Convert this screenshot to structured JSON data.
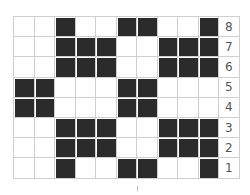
{
  "diagram": {
    "type": "knitting-chart",
    "columns": 10,
    "rows": 8,
    "colors": {
      "filled": "#2b2b2b",
      "empty": "#ffffff",
      "grid": "#cfcfcf",
      "label": "#555555"
    },
    "row_labels": [
      "8",
      "7",
      "6",
      "5",
      "4",
      "3",
      "2",
      "1"
    ],
    "pattern": [
      [
        0,
        0,
        1,
        0,
        0,
        1,
        1,
        0,
        0,
        1
      ],
      [
        0,
        0,
        1,
        1,
        1,
        0,
        0,
        1,
        1,
        1
      ],
      [
        0,
        0,
        1,
        1,
        1,
        0,
        0,
        1,
        1,
        1
      ],
      [
        1,
        1,
        0,
        0,
        0,
        1,
        1,
        0,
        0,
        0
      ],
      [
        1,
        1,
        0,
        0,
        0,
        1,
        1,
        0,
        0,
        0
      ],
      [
        0,
        0,
        1,
        1,
        1,
        0,
        0,
        1,
        1,
        1
      ],
      [
        0,
        0,
        1,
        1,
        1,
        0,
        0,
        1,
        1,
        1
      ],
      [
        0,
        0,
        1,
        0,
        0,
        1,
        1,
        0,
        0,
        1
      ]
    ]
  }
}
